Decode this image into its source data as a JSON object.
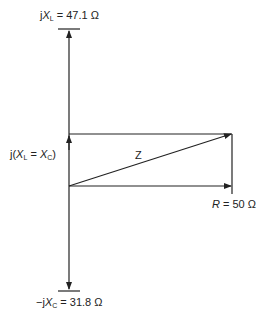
{
  "diagram": {
    "type": "impedance phasor diagram",
    "labels": {
      "xl_prefix": "j",
      "xl_var": "X",
      "xl_sub": "L",
      "xl_value": " = 47.1 Ω",
      "xc_prefix": "−j",
      "xc_var": "X",
      "xc_sub": "C",
      "xc_value": " = 31.8 Ω",
      "mid_open": "j(",
      "mid_var1": "X",
      "mid_sub1": "L",
      "mid_eq": " = ",
      "mid_var2": "X",
      "mid_sub2": "C",
      "mid_close": ")",
      "z_label": "Z",
      "r_var": "R",
      "r_value": " = 50 Ω"
    },
    "values": {
      "XL_ohm": 47.1,
      "XC_ohm": 31.8,
      "R_ohm": 50
    },
    "colors": {
      "line": "#222222",
      "background": "#ffffff"
    }
  }
}
